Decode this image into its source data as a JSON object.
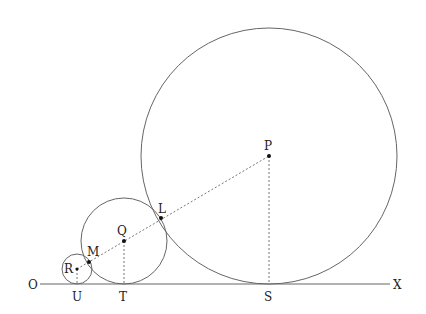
{
  "diagram": {
    "baseline": {
      "y": 284,
      "x1": 40,
      "x2": 390,
      "color": "#555555"
    },
    "circles": [
      {
        "name": "P",
        "cx": 269,
        "cy": 156,
        "r": 128
      },
      {
        "name": "Q",
        "cx": 124,
        "cy": 241,
        "r": 43
      },
      {
        "name": "R",
        "cx": 77,
        "cy": 269,
        "r": 15
      }
    ],
    "points": [
      {
        "name": "P",
        "x": 269,
        "y": 156
      },
      {
        "name": "Q",
        "x": 124,
        "y": 241
      },
      {
        "name": "R",
        "x": 77,
        "y": 269
      },
      {
        "name": "L",
        "x": 161,
        "y": 218
      },
      {
        "name": "M",
        "x": 89,
        "y": 262
      }
    ],
    "labels": {
      "O": "O",
      "X": "X",
      "P": "P",
      "Q": "Q",
      "R": "R",
      "L": "L",
      "M": "M",
      "U": "U",
      "T": "T",
      "S": "S"
    },
    "line_color": "#666666",
    "dash_color": "#777777"
  }
}
